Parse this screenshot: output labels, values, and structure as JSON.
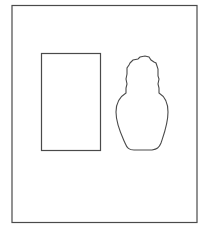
{
  "canvas": {
    "width": 211,
    "height": 230,
    "background": "#ffffff"
  },
  "stroke_color": "#4a4a4a",
  "shapes": [
    {
      "name": "outer-frame",
      "type": "rectangle"
    },
    {
      "name": "blank-rectangle",
      "type": "rectangle"
    },
    {
      "name": "vase-outline",
      "type": "silhouette"
    }
  ]
}
